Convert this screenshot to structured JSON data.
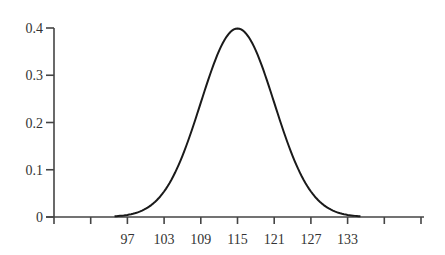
{
  "chart_data": {
    "type": "line",
    "title": "",
    "xlabel": "",
    "ylabel": "",
    "mean": 115,
    "sd": 6,
    "x_tick_labels": [
      "97",
      "103",
      "109",
      "115",
      "121",
      "127",
      "133"
    ],
    "x_ticks": [
      91,
      97,
      103,
      109,
      115,
      121,
      127,
      133,
      139,
      145
    ],
    "y_tick_labels": [
      "0",
      "0.1",
      "0.2",
      "0.3",
      "0.4"
    ],
    "y_ticks": [
      0,
      0.1,
      0.2,
      0.3,
      0.4
    ],
    "xlim": [
      85,
      145
    ],
    "ylim": [
      0,
      0.4
    ],
    "grid": false,
    "legend": null,
    "series": [
      {
        "name": "density",
        "x": [
          95,
          97,
          99,
          101,
          103,
          105,
          107,
          109,
          111,
          113,
          115,
          117,
          119,
          121,
          123,
          125,
          127,
          129,
          131,
          133,
          135
        ],
        "values": [
          0.002,
          0.004,
          0.01,
          0.022,
          0.054,
          0.092,
          0.165,
          0.242,
          0.319,
          0.377,
          0.399,
          0.377,
          0.319,
          0.242,
          0.165,
          0.092,
          0.054,
          0.022,
          0.01,
          0.004,
          0.002
        ]
      }
    ]
  },
  "axes": {
    "y_labels": [
      "0.4",
      "0.3",
      "0.2",
      "0.1",
      "0"
    ],
    "x_labels": [
      "97",
      "103",
      "109",
      "115",
      "121",
      "127",
      "133"
    ]
  }
}
